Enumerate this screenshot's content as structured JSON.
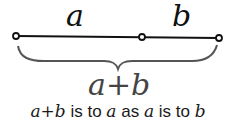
{
  "diagram": {
    "segment_labels": {
      "a": "a",
      "b": "b"
    },
    "brace_label": "a+b",
    "caption": {
      "parts": [
        "a+b",
        " is to ",
        "a",
        " as ",
        "a",
        " is to ",
        "b"
      ]
    },
    "points": [
      {
        "name": "left",
        "x": 16,
        "y": 36
      },
      {
        "name": "middle",
        "x": 142,
        "y": 37
      },
      {
        "name": "right",
        "x": 219,
        "y": 38
      }
    ],
    "colors": {
      "line": "#111111",
      "brace": "#555555",
      "text": "#1a1a1a"
    }
  }
}
